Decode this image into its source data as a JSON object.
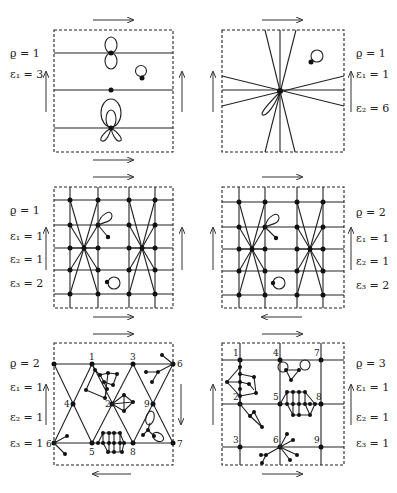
{
  "figure": {
    "panels": [
      {
        "id": "top-left",
        "labels": [
          "ϱ = 1",
          "ε₁ = 3"
        ],
        "labels_side": "left",
        "arrows": {
          "top": "right",
          "bottom": "right",
          "left": "up",
          "right": "up"
        },
        "vertex_numbers": []
      },
      {
        "id": "top-right",
        "labels": [
          "ϱ = 1",
          "ε₁ = 1",
          "ε₂ = 6"
        ],
        "labels_side": "right",
        "arrows": {
          "top": "right",
          "bottom": "right",
          "left": "up",
          "right": "up"
        },
        "vertex_numbers": []
      },
      {
        "id": "middle-left",
        "labels": [
          "ϱ = 1",
          "ε₁ = 1",
          "ε₂ = 1",
          "ε₃ = 2"
        ],
        "labels_side": "left",
        "arrows": {
          "top": "right",
          "bottom": "right",
          "left": "up",
          "right": "up"
        },
        "vertex_numbers": []
      },
      {
        "id": "middle-right",
        "labels": [
          "ϱ = 2",
          "ε₁ = 1",
          "ε₂ = 1",
          "ε₃ = 2"
        ],
        "labels_side": "right",
        "arrows": {
          "top": "right",
          "bottom": "left",
          "left": "up",
          "right": "up"
        },
        "vertex_numbers": []
      },
      {
        "id": "bottom-left",
        "labels": [
          "ϱ = 2",
          "ε₁ = 1",
          "ε₂ = 1",
          "ε₃ = 1"
        ],
        "labels_side": "left",
        "arrows": {
          "top": "right",
          "bottom": "left",
          "left": "up",
          "right": "down"
        },
        "vertex_numbers": [
          "1",
          "2",
          "3",
          "4",
          "5",
          "6",
          "6",
          "7",
          "8",
          "9"
        ]
      },
      {
        "id": "bottom-right",
        "labels": [
          "ϱ = 3",
          "ε₁ = 1",
          "ε₂ = 1",
          "ε₃ = 1"
        ],
        "labels_side": "right",
        "arrows": {
          "top": "right",
          "bottom": "right",
          "left": "up",
          "right": "up"
        },
        "vertex_numbers": [
          "1",
          "2",
          "3",
          "4",
          "5",
          "6",
          "7",
          "8",
          "9"
        ]
      }
    ]
  }
}
